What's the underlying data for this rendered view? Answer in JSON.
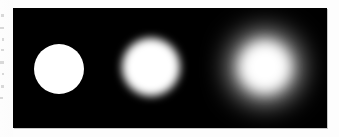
{
  "figure": {
    "caption": "",
    "panel": {
      "name": "blur-progression-panel",
      "background_color": "#000000",
      "page_background_color": "#fdfdfd",
      "border_shadow_color": "#c9c9c9",
      "x": 13,
      "y": 8,
      "width": 314,
      "height": 120
    },
    "discs": [
      {
        "name": "disc-sharp",
        "label": "sharp disc",
        "blur_level": "none",
        "blur_radius_px": 0,
        "fill_color": "#ffffff",
        "center_x": 59,
        "center_y": 69,
        "radius_px": 25
      },
      {
        "name": "disc-medium",
        "label": "moderately blurred disc",
        "blur_level": "medium",
        "blur_radius_px": 4,
        "fill_color": "#ffffff",
        "center_x": 151,
        "center_y": 67,
        "radius_px": 29
      },
      {
        "name": "disc-heavy",
        "label": "heavily blurred disc",
        "blur_level": "heavy",
        "blur_radius_px": 15,
        "fill_color": "#ffffff",
        "center_x": 265,
        "center_y": 67,
        "radius_px": 32
      }
    ],
    "scan_artifacts": {
      "present": true,
      "description": "faint illegible marks along left gutter",
      "speck_color": "#b9b9b9"
    }
  }
}
